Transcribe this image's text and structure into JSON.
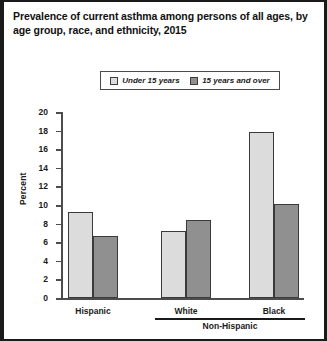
{
  "figure": {
    "title": "Prevalence of current asthma among persons of all ages, by age group, race, and ethnicity, 2015"
  },
  "legend": {
    "entries": [
      {
        "label": "Under 15 years",
        "swatch": "light-gray-swatch-icon",
        "color": "#dcdcdc"
      },
      {
        "label": "15 years and over",
        "swatch": "dark-gray-swatch-icon",
        "color": "#909090"
      }
    ]
  },
  "axes": {
    "y_label": "Percent",
    "y_ticks": [
      "0",
      "2",
      "4",
      "6",
      "8",
      "10",
      "12",
      "14",
      "16",
      "18",
      "20"
    ],
    "x_groups": [
      "Hispanic",
      "White",
      "Black"
    ],
    "x_bracket_label": "Non-Hispanic",
    "x_bracket_covers": [
      "White",
      "Black"
    ]
  },
  "chart_data": {
    "type": "bar",
    "title": "Prevalence of current asthma among persons of all ages, by age group, race, and ethnicity, 2015",
    "xlabel": "",
    "ylabel": "Percent",
    "ylim": [
      0,
      20
    ],
    "ytick_step": 2,
    "grid": false,
    "legend_position": "top-center",
    "categories": [
      "Hispanic",
      "White",
      "Black"
    ],
    "category_super_group": {
      "Non-Hispanic": [
        "White",
        "Black"
      ]
    },
    "series": [
      {
        "name": "Under 15 years",
        "color": "#dcdcdc",
        "values": [
          9.3,
          7.2,
          17.8
        ]
      },
      {
        "name": "15 years and over",
        "color": "#909090",
        "values": [
          6.7,
          8.4,
          10.1
        ]
      }
    ]
  }
}
